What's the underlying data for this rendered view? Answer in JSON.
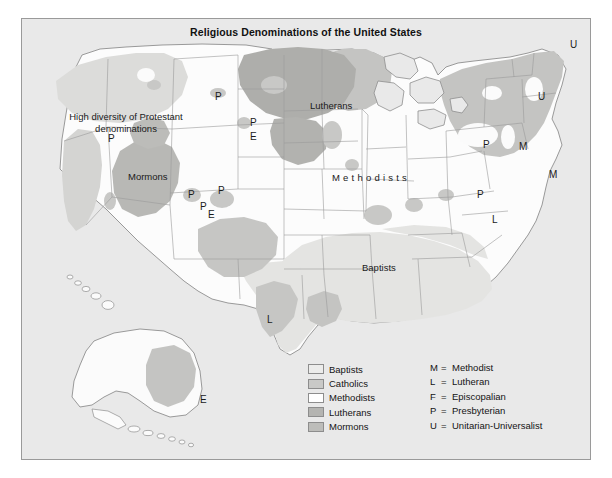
{
  "figure": {
    "title": "Religious Denominations of the United States",
    "background_color": "#ffffff",
    "map_background_color": "#e9e9e9",
    "border_color": "#9a9a9a"
  },
  "map_labels": {
    "regions": [
      {
        "text": "Lutherans",
        "x": 288,
        "y": 81
      },
      {
        "text": "Mormons",
        "x": 106,
        "y": 152
      },
      {
        "text": "Baptists",
        "x": 340,
        "y": 243
      },
      {
        "text": "Methodists",
        "x": 310,
        "y": 153
      }
    ],
    "note": {
      "line1": "High diversity of Protestant",
      "line2": "denominations",
      "x": 14,
      "y": 92
    },
    "letters": [
      {
        "text": "P",
        "x": 193,
        "y": 72
      },
      {
        "text": "P",
        "x": 228,
        "y": 98
      },
      {
        "text": "E",
        "x": 228,
        "y": 112
      },
      {
        "text": "P",
        "x": 86,
        "y": 114
      },
      {
        "text": "P",
        "x": 166,
        "y": 170
      },
      {
        "text": "P",
        "x": 178,
        "y": 182
      },
      {
        "text": "E",
        "x": 186,
        "y": 190
      },
      {
        "text": "P",
        "x": 196,
        "y": 166
      },
      {
        "text": "L",
        "x": 245,
        "y": 295
      },
      {
        "text": "E",
        "x": 178,
        "y": 375
      },
      {
        "text": "U",
        "x": 548,
        "y": 20
      },
      {
        "text": "U",
        "x": 516,
        "y": 72
      },
      {
        "text": "P",
        "x": 461,
        "y": 120
      },
      {
        "text": "M",
        "x": 497,
        "y": 122
      },
      {
        "text": "P",
        "x": 455,
        "y": 170
      },
      {
        "text": "M",
        "x": 527,
        "y": 150
      },
      {
        "text": "L",
        "x": 470,
        "y": 195
      }
    ]
  },
  "legend": {
    "swatches": [
      {
        "label": "Baptists",
        "color": "#ececeb",
        "border": "#8d8d8d"
      },
      {
        "label": "Catholics",
        "color": "#c9c9c7",
        "border": "#8d8d8d"
      },
      {
        "label": "Methodists",
        "color": "#ffffff",
        "border": "#8d8d8d"
      },
      {
        "label": "Lutherans",
        "color": "#b4b4b1",
        "border": "#8d8d8d"
      },
      {
        "label": "Mormons",
        "color": "#bdbdba",
        "border": "#8d8d8d"
      }
    ],
    "abbreviations": [
      {
        "key": "M",
        "eq": "=",
        "meaning": "Methodist"
      },
      {
        "key": "L",
        "eq": "=",
        "meaning": "Lutheran"
      },
      {
        "key": "F",
        "eq": "=",
        "meaning": "Episcopalian"
      },
      {
        "key": "P",
        "eq": "=",
        "meaning": "Presbyterian"
      },
      {
        "key": "U",
        "eq": "=",
        "meaning": "Unitarian-Universalist"
      }
    ]
  }
}
